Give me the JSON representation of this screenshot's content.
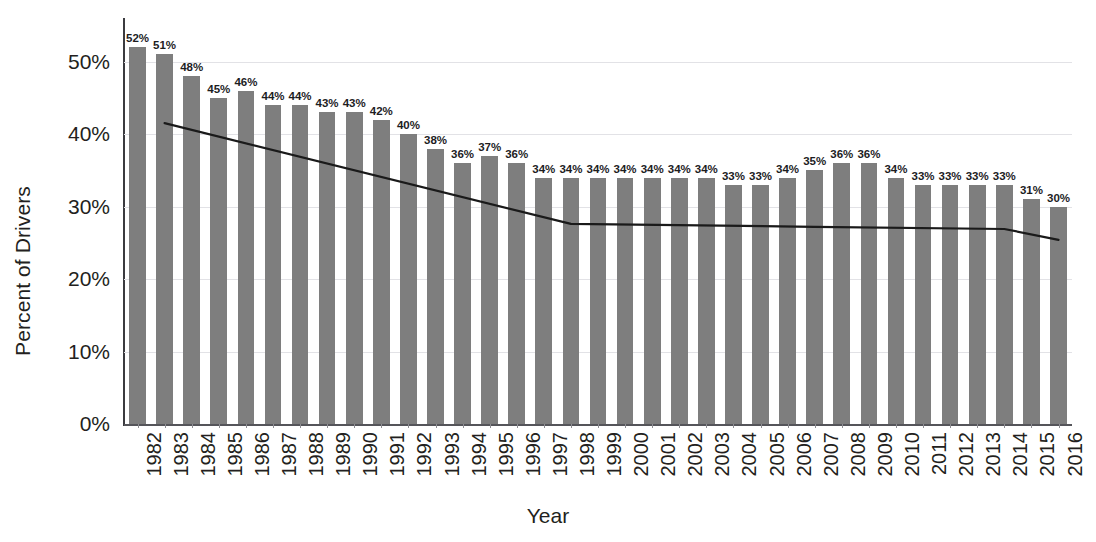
{
  "chart_data": {
    "type": "bar",
    "title": "",
    "xlabel": "Year",
    "ylabel": "Percent of Drivers",
    "ylim": [
      0,
      56
    ],
    "ytick_labels": [
      "0%",
      "10%",
      "20%",
      "30%",
      "40%",
      "50%"
    ],
    "ytick_values": [
      0,
      10,
      20,
      30,
      40,
      50
    ],
    "grid": true,
    "legend": "none",
    "bar_color": "#7e7e7e",
    "trendline_color": "#1a1a1a",
    "categories": [
      "1982",
      "1983",
      "1984",
      "1985",
      "1986",
      "1987",
      "1988",
      "1989",
      "1990",
      "1991",
      "1992",
      "1993",
      "1994",
      "1995",
      "1996",
      "1997",
      "1998",
      "1999",
      "2000",
      "2001",
      "2002",
      "2003",
      "2004",
      "2005",
      "2006",
      "2007",
      "2008",
      "2009",
      "2010",
      "2011",
      "2012",
      "2013",
      "2014",
      "2015",
      "2016"
    ],
    "values": [
      52,
      51,
      48,
      45,
      46,
      44,
      44,
      43,
      43,
      42,
      40,
      38,
      36,
      37,
      36,
      34,
      34,
      34,
      34,
      34,
      34,
      34,
      33,
      33,
      34,
      35,
      36,
      36,
      34,
      33,
      33,
      33,
      33,
      31,
      30
    ],
    "data_labels": [
      "52%",
      "51%",
      "48%",
      "45%",
      "46%",
      "44%",
      "44%",
      "43%",
      "43%",
      "42%",
      "40%",
      "38%",
      "36%",
      "37%",
      "36%",
      "34%",
      "34%",
      "34%",
      "34%",
      "34%",
      "34%",
      "34%",
      "33%",
      "33%",
      "34%",
      "35%",
      "36%",
      "36%",
      "34%",
      "33%",
      "33%",
      "33%",
      "33%",
      "31%",
      "30%"
    ],
    "trendline": {
      "name": "trend",
      "points": [
        {
          "x_index": 1,
          "y": 41.5
        },
        {
          "x_index": 16,
          "y": 27.6
        },
        {
          "x_index": 25,
          "y": 27.2
        },
        {
          "x_index": 32,
          "y": 26.9
        },
        {
          "x_index": 34,
          "y": 25.4
        }
      ]
    }
  }
}
